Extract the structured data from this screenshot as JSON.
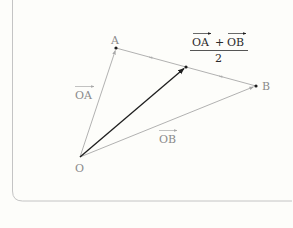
{
  "diagram": {
    "type": "vector-diagram",
    "points": {
      "O": {
        "label": "O",
        "x": 80,
        "y": 157
      },
      "A": {
        "label": "A",
        "x": 116,
        "y": 48
      },
      "B": {
        "label": "B",
        "x": 256,
        "y": 86
      },
      "M": {
        "label": "",
        "x": 186,
        "y": 67
      }
    },
    "vectors": [
      {
        "from": "O",
        "to": "A",
        "label": "OA",
        "style": "light"
      },
      {
        "from": "O",
        "to": "B",
        "label": "OB",
        "style": "light"
      },
      {
        "from": "O",
        "to": "M",
        "label": "",
        "style": "bold"
      },
      {
        "from": "A",
        "to": "B",
        "label": "",
        "style": "light"
      }
    ],
    "labels": {
      "point_O": "O",
      "point_A": "A",
      "point_B": "B",
      "vec_OA": "OA",
      "vec_OB": "OB",
      "formula_num_left": "OA",
      "formula_plus": "+",
      "formula_num_right": "OB",
      "formula_den": "2"
    },
    "colors": {
      "light_line": "#a8a8a8",
      "dark_line": "#1e1e1e",
      "label_gray": "#8a8a8a",
      "label_dark": "#2a2a2a",
      "frame": "#c4c4c4",
      "background": "#fdfdfa"
    }
  }
}
